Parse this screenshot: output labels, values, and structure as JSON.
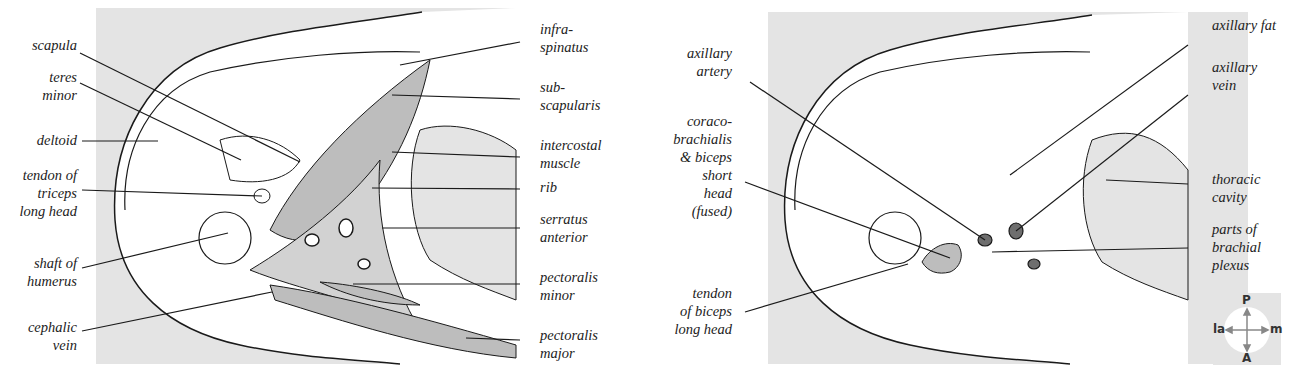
{
  "figure": {
    "left_panel": {
      "labels_left": [
        {
          "id": "scapula",
          "text": "scapula"
        },
        {
          "id": "teres-minor",
          "text": "teres\nminor"
        },
        {
          "id": "deltoid",
          "text": "deltoid"
        },
        {
          "id": "tendon-triceps",
          "text": "tendon of\ntriceps\nlong head"
        },
        {
          "id": "shaft-humerus",
          "text": "shaft of\nhumerus"
        },
        {
          "id": "cephalic-vein",
          "text": "cephalic\nvein"
        }
      ],
      "labels_right": [
        {
          "id": "infraspinatus",
          "text": "infra-\nspinatus"
        },
        {
          "id": "subscapularis",
          "text": "sub-\nscapularis"
        },
        {
          "id": "intercostal-muscle",
          "text": "intercostal\nmuscle"
        },
        {
          "id": "rib",
          "text": "rib"
        },
        {
          "id": "serratus-anterior",
          "text": "serratus\nanterior"
        },
        {
          "id": "pectoralis-minor",
          "text": "pectoralis\nminor"
        },
        {
          "id": "pectoralis-major",
          "text": "pectoralis\nmajor"
        }
      ]
    },
    "right_panel": {
      "labels_left": [
        {
          "id": "axillary-artery",
          "text": "axillary\nartery"
        },
        {
          "id": "coracobrachialis",
          "text": "coraco-\nbrachialis\n& biceps\nshort\nhead\n(fused)"
        },
        {
          "id": "tendon-biceps",
          "text": "tendon\nof biceps\nlong head"
        }
      ],
      "labels_right": [
        {
          "id": "axillary-fat",
          "text": "axillary fat"
        },
        {
          "id": "axillary-vein",
          "text": "axillary\nvein"
        },
        {
          "id": "thoracic-cavity",
          "text": "thoracic\ncavity"
        },
        {
          "id": "brachial-plexus",
          "text": "parts of\nbrachial\nplexus"
        }
      ]
    },
    "compass": {
      "top": "P",
      "bottom": "A",
      "left": "la",
      "right": "m"
    },
    "colors": {
      "background": "#e4e4e4",
      "muscle_shaded": "#bdbdbd",
      "vessel_dark": "#6e6e6e",
      "line": "#1a1a1a",
      "tissue": "#ffffff"
    }
  }
}
